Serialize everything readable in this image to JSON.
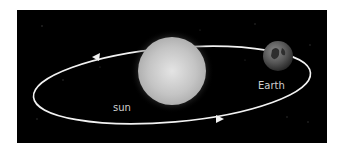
{
  "diagram": {
    "background_color": "#000000",
    "labels": {
      "sun": "sun",
      "earth": "Earth"
    },
    "bodies": [
      {
        "name": "sun",
        "cx": 172,
        "cy": 70,
        "r": 34
      },
      {
        "name": "Earth",
        "cx": 278,
        "cy": 57,
        "r": 15
      }
    ],
    "orbit": {
      "cx": 172,
      "cy": 85,
      "rx": 139,
      "ry": 37,
      "rotation": -5,
      "direction": "counterclockwise"
    }
  }
}
